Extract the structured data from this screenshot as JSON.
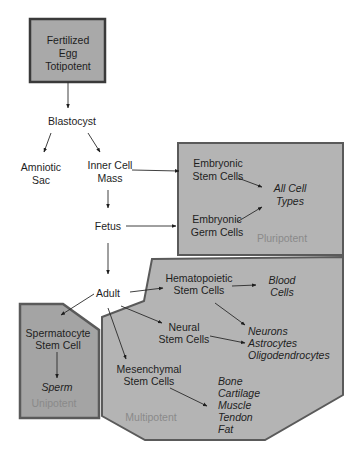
{
  "diagram": {
    "type": "stem-cell-potency-hierarchy",
    "colors": {
      "region_fill": "#b4b4b4",
      "region_border": "#5a5a5a",
      "totipotent_fill": "#a9a9a9",
      "unipotent_fill": "#a4a4a4",
      "text": "#1e1e1e",
      "potency_label": "#8a8a8a"
    },
    "totipotent": {
      "line1": "Fertilized",
      "line2": "Egg",
      "line3": "Totipotent"
    },
    "blastocyst": "Blastocyst",
    "amniotic_sac": {
      "line1": "Amniotic",
      "line2": "Sac"
    },
    "inner_cell_mass": {
      "line1": "Inner Cell",
      "line2": "Mass"
    },
    "fetus": "Fetus",
    "adult": "Adult",
    "pluripotent": {
      "label": "Pluripotent",
      "embryonic_stem_cells": {
        "line1": "Embryonic",
        "line2": "Stem Cells"
      },
      "embryonic_germ_cells": {
        "line1": "Embryonic",
        "line2": "Germ Cells"
      },
      "all_cell_types": {
        "line1": "All Cell",
        "line2": "Types"
      }
    },
    "multipotent": {
      "label": "Multipotent",
      "hematopoietic": {
        "line1": "Hematopoietic",
        "line2": "Stem Cells"
      },
      "blood_cells": {
        "line1": "Blood",
        "line2": "Cells"
      },
      "neural": {
        "line1": "Neural",
        "line2": "Stem Cells"
      },
      "neural_products": [
        "Neurons",
        "Astrocytes",
        "Oligodendrocytes"
      ],
      "mesenchymal": {
        "line1": "Mesenchymal",
        "line2": "Stem Cells"
      },
      "mesenchymal_products": [
        "Bone",
        "Cartilage",
        "Muscle",
        "Tendon",
        "Fat"
      ]
    },
    "unipotent": {
      "label": "Unipotent",
      "spermatocyte": {
        "line1": "Spermatocyte",
        "line2": "Stem Cell"
      },
      "sperm": "Sperm"
    }
  }
}
